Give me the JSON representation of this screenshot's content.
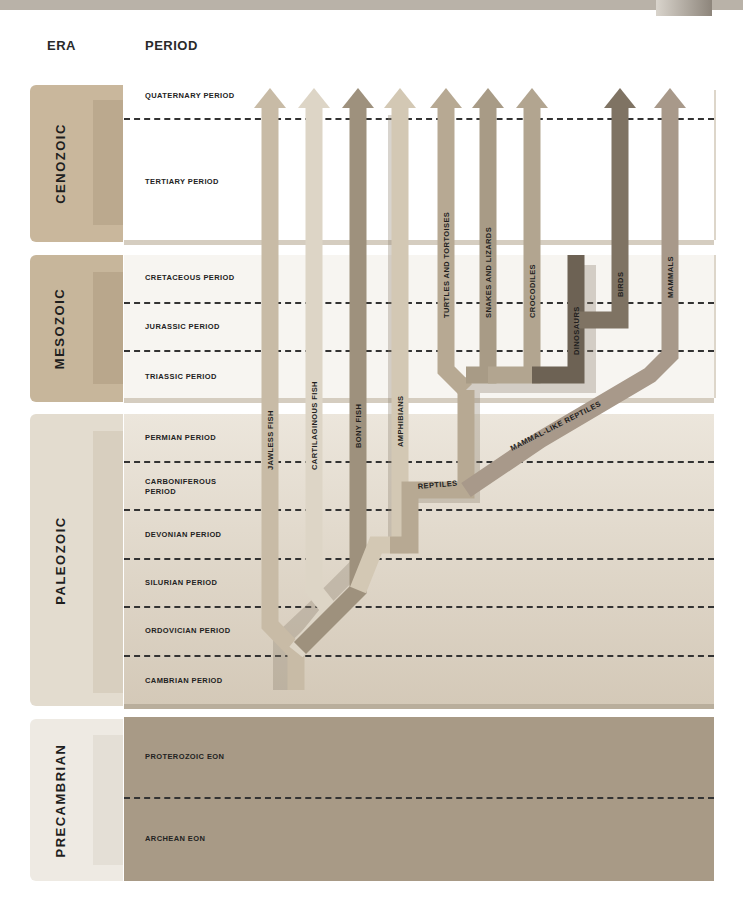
{
  "header": {
    "era_label": "ERA",
    "period_label": "PERIOD"
  },
  "eras": [
    {
      "name": "CENOZOIC",
      "periods": [
        "QUATERNARY PERIOD",
        "TERTIARY PERIOD"
      ]
    },
    {
      "name": "MESOZOIC",
      "periods": [
        "CRETACEOUS PERIOD",
        "JURASSIC PERIOD",
        "TRIASSIC PERIOD"
      ]
    },
    {
      "name": "PALEOZOIC",
      "periods": [
        "PERMIAN PERIOD",
        "CARBONIFEROUS PERIOD",
        "DEVONIAN PERIOD",
        "SILURIAN PERIOD",
        "ORDOVICIAN PERIOD",
        "CAMBRIAN PERIOD"
      ]
    },
    {
      "name": "PRECAMBRIAN",
      "periods": [
        "PROTEROZOIC EON",
        "ARCHEAN EON"
      ]
    }
  ],
  "periods": {
    "quaternary": "QUATERNARY PERIOD",
    "tertiary": "TERTIARY PERIOD",
    "cretaceous": "CRETACEOUS PERIOD",
    "jurassic": "JURASSIC PERIOD",
    "triassic": "TRIASSIC PERIOD",
    "permian": "PERMIAN PERIOD",
    "carboniferous_1": "CARBONIFEROUS",
    "carboniferous_2": "PERIOD",
    "devonian": "DEVONIAN PERIOD",
    "silurian": "SILURIAN PERIOD",
    "ordovician": "ORDOVICIAN PERIOD",
    "cambrian": "CAMBRIAN PERIOD",
    "proterozoic": "PROTEROZOIC EON",
    "archean": "ARCHEAN EON"
  },
  "lineages": {
    "jawless_fish": "JAWLESS FISH",
    "cartilaginous_fish": "CARTILAGINOUS FISH",
    "bony_fish": "BONY FISH",
    "amphibians": "AMPHIBIANS",
    "turtles": "TURTLES AND TORTOISES",
    "snakes": "SNAKES AND LIZARDS",
    "crocodiles": "CROCODILES",
    "dinosaurs": "DINOSAURS",
    "birds": "BIRDS",
    "mammals": "MAMMALS",
    "reptiles": "REPTILES",
    "mammal_like_reptiles": "MAMMAL-LIKE REPTILES"
  },
  "colors": {
    "cenozoic_tab": "#c9b79c",
    "mesozoic_tab": "#c7b69b",
    "paleozoic_tab": "#e3dccf",
    "precambrian_tab": "#eeeae3",
    "precambrian_panel": "#a89a86",
    "jawless_fish": "#c8bba6",
    "cartilaginous_fish": "#ddd5c6",
    "bony_fish": "#9e917d",
    "amphibians": "#d3c8b4",
    "reptile_trunk": "#b7a993",
    "dinosaurs": "#6d6254",
    "birds": "#7f7363",
    "mammals": "#a8998a"
  }
}
